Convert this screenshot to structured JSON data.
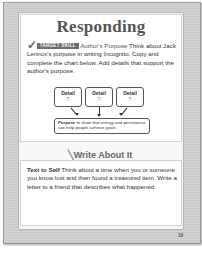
{
  "page": {
    "title": "Responding",
    "page_number": "19",
    "caption_fragment": "…"
  },
  "target_skill": {
    "badge": "TARGET SKILL",
    "name": "Author's Purpose",
    "text": " Think about Jack Lennox's purpose in writing Incognito. Copy and complete the chart below. Add details that support the author's purpose."
  },
  "chart": {
    "details": [
      {
        "label": "Detail",
        "value": "?"
      },
      {
        "label": "Detail",
        "value": "?"
      },
      {
        "label": "Detail",
        "value": "?"
      }
    ],
    "purpose_label": "Purpose",
    "purpose_text": " to show that energy and persistence can help people achieve goals"
  },
  "write_about_it": {
    "title": "Write About It",
    "label": "Text to Self",
    "text": " Think about a time when you or someone you know lost and then found a treasured item. Write a letter to a friend that describes what happened."
  }
}
